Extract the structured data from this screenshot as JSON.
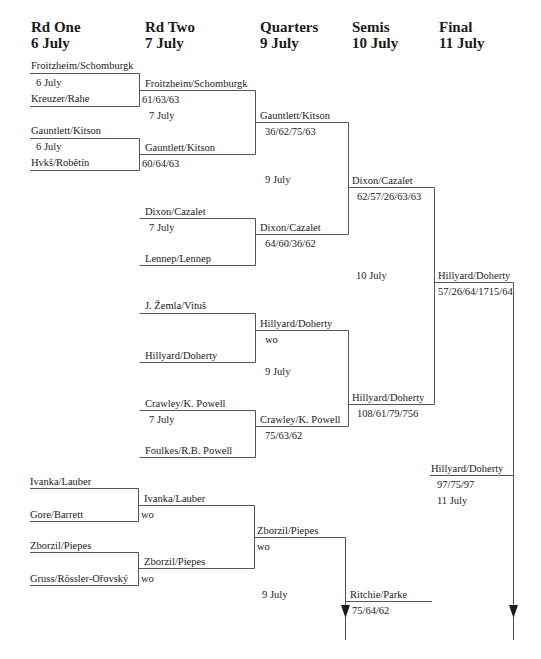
{
  "headers": [
    {
      "round": "Rd One",
      "date": "6 July"
    },
    {
      "round": "Rd Two",
      "date": "7 July"
    },
    {
      "round": "Quarters",
      "date": "9 July"
    },
    {
      "round": "Semis",
      "date": "10 July"
    },
    {
      "round": "Final",
      "date": "11 July"
    }
  ],
  "round1": {
    "m1": {
      "top": "Froitzheim/Schomburgk",
      "date": "6 July",
      "bottom": "Kreuzer/Rahe"
    },
    "m2": {
      "top": "Gauntlett/Kitson",
      "date": "6 July",
      "bottom": "Hvkš/Robětín"
    },
    "m3": {
      "top": "Ivanka/Lauber",
      "bottom": "Gore/Barrett"
    },
    "m4": {
      "top": "Zborzil/Piepes",
      "bottom": "Gruss/Rössler-Ořovský"
    }
  },
  "round2": {
    "m1": {
      "winner": "Froitzheim/Schomburgk",
      "score": "61/63/63"
    },
    "m2": {
      "winner": "Gauntlett/Kitson",
      "score": "60/64/63"
    },
    "date_a": "7 July",
    "m3": {
      "top": "Dixon/Cazalet",
      "date": "7 July",
      "bottom": "Lennep/Lennep"
    },
    "m4": {
      "top": "J. Žemla/Vituš",
      "bottom": "Hillyard/Doherty"
    },
    "m5": {
      "top": "Crawley/K. Powell",
      "date": "7 July",
      "bottom": "Foulkes/R.B. Powell"
    },
    "m6": {
      "winner": "Ivanka/Lauber",
      "score": "wo"
    },
    "m7": {
      "winner": "Zborzil/Piepes",
      "score": "wo"
    }
  },
  "quarters": {
    "q1": {
      "winner": "Gauntlett/Kitson",
      "score": "36/62/75/63"
    },
    "date_a": "9 July",
    "q2": {
      "winner": "Dixon/Cazalet",
      "score": "64/60/36/62"
    },
    "q3": {
      "winner": "Hillyard/Doherty",
      "score": "wo"
    },
    "date_b": "9 July",
    "q4": {
      "winner": "Crawley/K. Powell",
      "score": "75/63/62"
    },
    "q5": {
      "winner": "Zborzil/Piepes",
      "score": "wo"
    },
    "date_c": "9 July"
  },
  "semis": {
    "s1": {
      "winner": "Dixon/Cazalet",
      "score": "62/57/26/63/63"
    },
    "date_a": "10 July",
    "s2": {
      "winner": "Hillyard/Doherty",
      "score": "108/61/79/756"
    },
    "s3": {
      "winner": "Ritchie/Parke",
      "score": "75/64/62"
    }
  },
  "final": {
    "f1": {
      "winner": "Hillyard/Doherty",
      "score": "57/26/64/1715/64"
    },
    "f2": {
      "winner": "Hillyard/Doherty",
      "score": "97/75/97",
      "date": "11 July"
    }
  },
  "colors": {
    "line": "#555555",
    "text": "#1a1a1a"
  }
}
